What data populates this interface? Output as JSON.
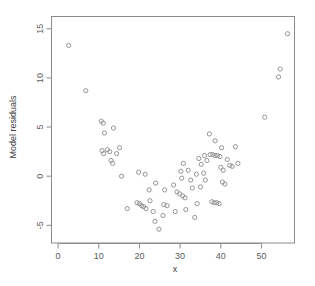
{
  "chart_data": {
    "type": "scatter",
    "title": "",
    "xlabel": "x",
    "ylabel": "Model residuals",
    "xlim": [
      -1.5,
      58
    ],
    "ylim": [
      -6.8,
      16.2
    ],
    "xticks": [
      0,
      10,
      20,
      30,
      40,
      50
    ],
    "xticklabels": [
      "0",
      "10",
      "20",
      "30",
      "40",
      "50"
    ],
    "yticks": [
      -5,
      0,
      5,
      10,
      15
    ],
    "yticklabels": [
      "-5",
      "0",
      "5",
      "10",
      "15"
    ],
    "grid": false,
    "legend": null,
    "marker": "open-circle",
    "marker_color": "#8a8a8a",
    "frame_color": "#8c8c8c",
    "points": [
      [
        2.6,
        13.3
      ],
      [
        6.8,
        8.7
      ],
      [
        10.6,
        5.6
      ],
      [
        11.1,
        5.4
      ],
      [
        11.4,
        4.4
      ],
      [
        13.6,
        4.9
      ],
      [
        10.8,
        2.6
      ],
      [
        11.2,
        2.3
      ],
      [
        12.1,
        2.7
      ],
      [
        12.7,
        2.5
      ],
      [
        13.0,
        1.6
      ],
      [
        13.4,
        1.3
      ],
      [
        14.4,
        2.3
      ],
      [
        15.1,
        2.9
      ],
      [
        15.6,
        0.0
      ],
      [
        19.8,
        0.4
      ],
      [
        21.4,
        0.2
      ],
      [
        22.4,
        -1.4
      ],
      [
        17.0,
        -3.3
      ],
      [
        19.4,
        -2.7
      ],
      [
        20.0,
        -2.8
      ],
      [
        20.5,
        -3.0
      ],
      [
        21.0,
        -3.1
      ],
      [
        21.6,
        -3.3
      ],
      [
        23.8,
        -4.6
      ],
      [
        24.8,
        -5.4
      ],
      [
        25.8,
        -4.0
      ],
      [
        22.6,
        -2.5
      ],
      [
        23.4,
        -3.6
      ],
      [
        26.0,
        -2.9
      ],
      [
        26.8,
        -3.0
      ],
      [
        24.0,
        -0.7
      ],
      [
        26.2,
        -1.4
      ],
      [
        28.4,
        -0.9
      ],
      [
        29.2,
        -1.6
      ],
      [
        29.9,
        -1.8
      ],
      [
        30.6,
        -2.0
      ],
      [
        31.2,
        -2.2
      ],
      [
        28.8,
        -3.6
      ],
      [
        31.4,
        -3.4
      ],
      [
        30.2,
        0.5
      ],
      [
        30.8,
        1.3
      ],
      [
        32.0,
        0.6
      ],
      [
        30.4,
        -0.2
      ],
      [
        32.6,
        -0.4
      ],
      [
        33.6,
        -4.2
      ],
      [
        34.2,
        -2.8
      ],
      [
        33.0,
        -1.2
      ],
      [
        34.0,
        0.2
      ],
      [
        35.0,
        -1.1
      ],
      [
        34.6,
        1.8
      ],
      [
        35.2,
        1.2
      ],
      [
        35.8,
        0.3
      ],
      [
        36.2,
        -0.4
      ],
      [
        36.0,
        2.1
      ],
      [
        36.6,
        1.6
      ],
      [
        37.2,
        4.3
      ],
      [
        38.6,
        3.6
      ],
      [
        37.4,
        2.2
      ],
      [
        38.0,
        2.2
      ],
      [
        38.6,
        2.1
      ],
      [
        39.2,
        2.1
      ],
      [
        39.8,
        2.0
      ],
      [
        37.8,
        -2.6
      ],
      [
        38.4,
        -2.7
      ],
      [
        39.0,
        -2.7
      ],
      [
        39.6,
        -2.8
      ],
      [
        40.0,
        0.9
      ],
      [
        40.6,
        0.6
      ],
      [
        40.4,
        -0.6
      ],
      [
        41.0,
        -0.8
      ],
      [
        40.2,
        2.9
      ],
      [
        41.6,
        1.7
      ],
      [
        42.2,
        1.1
      ],
      [
        42.8,
        1.0
      ],
      [
        43.6,
        3.0
      ],
      [
        44.2,
        1.3
      ],
      [
        50.8,
        6.0
      ],
      [
        54.2,
        10.1
      ],
      [
        54.6,
        10.9
      ],
      [
        56.4,
        14.5
      ]
    ]
  }
}
